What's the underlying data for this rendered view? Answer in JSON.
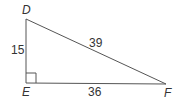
{
  "diagram": {
    "type": "right-triangle",
    "vertices": {
      "top": "D",
      "right_angle": "E",
      "right": "F"
    },
    "sides": {
      "DE": "15",
      "DF": "39",
      "EF": "36"
    },
    "right_angle_at": "E",
    "stroke_color": "#555555"
  }
}
